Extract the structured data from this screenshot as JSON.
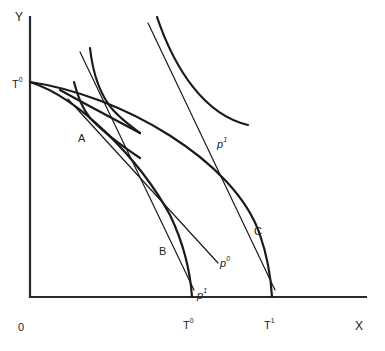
{
  "diagram": {
    "type": "production-possibility-frontier",
    "axes": {
      "x_label": "X",
      "y_label": "Y",
      "origin_label": "0"
    },
    "curves": {
      "inner_ppf": {
        "label_base": "T",
        "label_sup": "0"
      },
      "outer_ppf": {
        "label_base": "T",
        "label_sup": "1"
      },
      "y_intercept": {
        "label_base": "T",
        "label_sup": "0"
      }
    },
    "points": {
      "a": "A",
      "b": "B",
      "c": "C"
    },
    "price_lines": {
      "p0": {
        "label_base": "p",
        "label_sup": "0"
      },
      "p1_lower": {
        "label_base": "p",
        "label_sup": "1"
      },
      "p1_upper": {
        "label_base": "p",
        "label_sup": "1"
      }
    }
  }
}
